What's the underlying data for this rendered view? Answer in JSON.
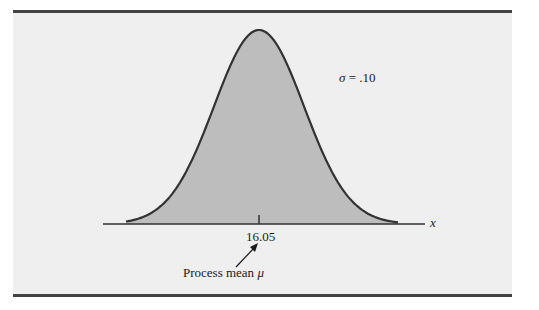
{
  "chart_data": {
    "type": "area",
    "title": "",
    "subtitle": "",
    "distribution": "normal",
    "mean": 16.05,
    "std_dev": 0.1,
    "xlabel": "x",
    "ylabel": "",
    "x_ticks": [
      16.05
    ],
    "x_tick_labels": [
      "16.05"
    ],
    "annotations": [
      {
        "text": "σ = .10",
        "position": "upper right of curve"
      },
      {
        "text": "Process mean μ",
        "points_to": 16.05
      }
    ],
    "grid": false,
    "legend": "none"
  },
  "labels": {
    "sigma_symbol": "σ",
    "sigma_value": " = .10",
    "x_axis": "x",
    "mean_tick": "16.05",
    "mean_annotation_text": "Process mean ",
    "mean_annotation_symbol": "μ"
  },
  "colors": {
    "background": "#efefef",
    "fill": "#bdbdbd",
    "curve": "#333333",
    "axis": "#333333",
    "rule": "#444444"
  }
}
